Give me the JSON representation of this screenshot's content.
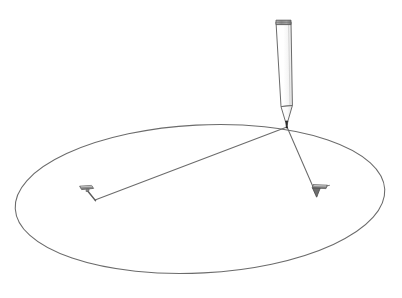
{
  "figure": {
    "background_color": "#ffffff",
    "width": 402,
    "height": 298,
    "line_color": "#6b6b6b",
    "dark_line_color": "#3a3a3a",
    "pin_fill_color": "#9a9a9a",
    "pin_dark_color": "#5a5a5a",
    "pencil_cap_color": "#8c8c8c",
    "pencil_tip_color": "#2b2b2b"
  },
  "chart_data": {
    "type": "diagram",
    "subtitle": "",
    "elements": [
      {
        "name": "ellipse-curve",
        "label": "ellipse",
        "shape": "ellipse",
        "center_x": 200,
        "center_y": 199,
        "radius_x": 185,
        "radius_y": 74,
        "rotation_deg": -3,
        "filled": false,
        "stroke": "#6b6b6b",
        "stroke_width": 1
      },
      {
        "name": "pencil-body",
        "label": "pencil",
        "shape": "tapered-prism",
        "top_x": 283,
        "top_y": 20,
        "tip_x": 287,
        "tip_y": 127,
        "top_width": 15,
        "shoulder_y": 106,
        "shoulder_width": 12
      },
      {
        "name": "string-left",
        "label": "string to left pin",
        "shape": "line",
        "x1": 287,
        "y1": 127,
        "x2": 95,
        "y2": 200
      },
      {
        "name": "string-right",
        "label": "string to right pin",
        "shape": "line",
        "x1": 287,
        "y1": 127,
        "x2": 317,
        "y2": 196
      },
      {
        "name": "pin-left",
        "label": "left pin (focus 1)",
        "shape": "pin",
        "head_x": 86,
        "head_y": 187,
        "point_x": 95,
        "point_y": 200
      },
      {
        "name": "pin-right",
        "label": "right pin (focus 2)",
        "shape": "pin",
        "head_x": 320,
        "head_y": 187,
        "point_x": 317,
        "point_y": 197
      }
    ],
    "annotations": [],
    "legend": [],
    "grid": false,
    "xlabel": "",
    "ylabel": ""
  },
  "labels": {
    "ellipse": "ellipse",
    "pencil": "pencil",
    "pin_left": "left pin",
    "pin_right": "right pin",
    "string_left": "string to left pin",
    "string_right": "string to right pin"
  }
}
